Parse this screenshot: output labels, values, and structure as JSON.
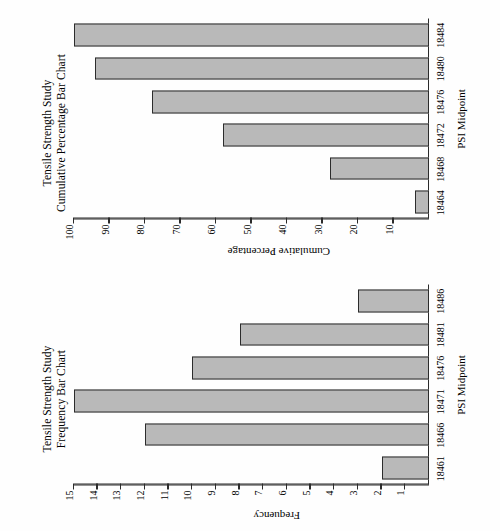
{
  "page": {
    "orientation": "rotated-90-ccw",
    "background": "#ffffff",
    "bar_fill": "#b9b9b9",
    "bar_stroke": "#2c2c2c",
    "axis_color": "#2b2b2b"
  },
  "charts": [
    {
      "id": "frequency",
      "title_line1": "Tensile Strength Study",
      "title_line2": "Frequency Bar Chart",
      "xlabel": "PSI Midpoint",
      "ylabel": "Frequency"
    },
    {
      "id": "cumulative",
      "title_line1": "Tensile Strength Study",
      "title_line2": "Cumulative Percentage Bar Chart",
      "xlabel": "PSI Midpoint",
      "ylabel": "Cumulative Percentage"
    }
  ],
  "chart_data": [
    {
      "type": "bar",
      "id": "frequency",
      "title": "Tensile Strength Study Frequency Bar Chart",
      "xlabel": "PSI Midpoint",
      "ylabel": "Frequency",
      "categories": [
        "18461",
        "18466",
        "18471",
        "18476",
        "18481",
        "18486"
      ],
      "values": [
        2,
        12,
        15,
        10,
        8,
        3
      ],
      "ylim": [
        0,
        15
      ],
      "yticks": [
        1,
        2,
        3,
        4,
        5,
        6,
        7,
        8,
        9,
        10,
        11,
        12,
        13,
        14,
        15
      ],
      "grid": false,
      "legend": "none",
      "orientation": "vertical"
    },
    {
      "type": "bar",
      "id": "cumulative",
      "title": "Tensile Strength Study Cumulative Percentage Bar Chart",
      "xlabel": "PSI Midpoint",
      "ylabel": "Cumulative Percentage",
      "categories": [
        "18464",
        "18468",
        "18472",
        "18476",
        "18480",
        "18484"
      ],
      "values": [
        4,
        28,
        58,
        78,
        94,
        100
      ],
      "ylim": [
        0,
        100
      ],
      "yticks": [
        10,
        20,
        30,
        40,
        50,
        60,
        70,
        80,
        90,
        100
      ],
      "grid": false,
      "legend": "none",
      "orientation": "vertical"
    }
  ]
}
